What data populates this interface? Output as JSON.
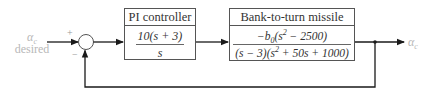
{
  "input": {
    "symbol": "α",
    "subscript": "c",
    "caption": "desired"
  },
  "summing_junction": {
    "plus_sign": "+",
    "minus_sign": "−"
  },
  "pi_controller": {
    "title": "PI controller",
    "numerator": "10(s + 3)",
    "denominator": "s"
  },
  "plant": {
    "title": "Bank-to-turn missile",
    "numerator_prefix": "−b",
    "numerator_sub": "0",
    "numerator_mid": "(s",
    "numerator_sup": "2",
    "numerator_suffix": " − 2500)",
    "denominator_prefix": "(s − 3)(s",
    "denominator_sup": "2",
    "denominator_suffix": " + 50s + 1000)"
  },
  "output": {
    "symbol": "α",
    "subscript": "c"
  },
  "colors": {
    "line": "#1a1a1a",
    "box_border": "#555555",
    "faint_label": "#b8b8b8"
  }
}
